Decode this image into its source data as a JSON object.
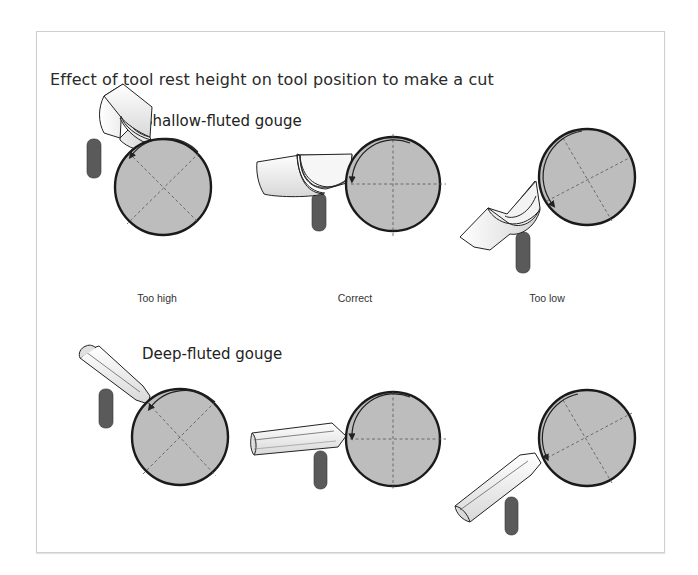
{
  "figure": {
    "title": "Effect of tool rest height on tool position to make a cut",
    "sections": [
      {
        "label": "Shallow-fluted gouge",
        "panels": [
          {
            "caption": "Too high"
          },
          {
            "caption": "Correct"
          },
          {
            "caption": "Too low"
          }
        ]
      },
      {
        "label": "Deep-fluted gouge",
        "panels": [
          {
            "caption": ""
          },
          {
            "caption": ""
          },
          {
            "caption": ""
          }
        ]
      }
    ]
  },
  "colors": {
    "workpiece_fill": "#bdbdbd",
    "workpiece_stroke": "#1a1a1a",
    "tool_rest": "#5a5a5a",
    "gouge_fill": "#f2f2f2",
    "frame_border": "#cfcfcf"
  }
}
